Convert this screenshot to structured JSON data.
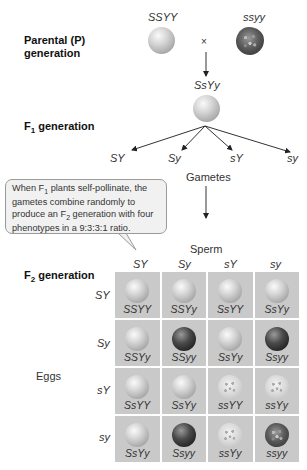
{
  "parental": {
    "label_line1": "Parental (P)",
    "label_line2": "generation",
    "parent1": {
      "genotype": "SSYY",
      "phenotype": "yellow-round"
    },
    "cross_symbol": "×",
    "parent2": {
      "genotype": "ssyy",
      "phenotype": "green-wrinkled"
    }
  },
  "f1": {
    "label_main": "F",
    "label_sub": "1",
    "label_rest": " generation",
    "genotype": "SsYy",
    "phenotype": "yellow-round"
  },
  "gametes": {
    "items": [
      "SY",
      "Sy",
      "sY",
      "sy"
    ],
    "label": "Gametes"
  },
  "callout": {
    "line1_a": "When F",
    "line1_sub": "1",
    "line1_b": " plants self-pollinate, the",
    "line2": "gametes combine randomly to",
    "line3_a": "produce an F",
    "line3_sub": "2",
    "line3_b": " generation with four",
    "line4": "phenotypes in a 9:3:3:1 ratio."
  },
  "f2": {
    "label_main": "F",
    "label_sub": "2",
    "label_rest": " generation",
    "sperm_label": "Sperm",
    "eggs_label": "Eggs",
    "sperm": [
      "SY",
      "Sy",
      "sY",
      "sy"
    ],
    "eggs": [
      "SY",
      "Sy",
      "sY",
      "sy"
    ],
    "rows": [
      [
        {
          "g": "SSYY",
          "p": "yr"
        },
        {
          "g": "SSYy",
          "p": "yr"
        },
        {
          "g": "SsYY",
          "p": "yr"
        },
        {
          "g": "SsYy",
          "p": "yr"
        }
      ],
      [
        {
          "g": "SSYy",
          "p": "yr"
        },
        {
          "g": "SSyy",
          "p": "gr"
        },
        {
          "g": "SsYy",
          "p": "yr"
        },
        {
          "g": "Ssyy",
          "p": "gr"
        }
      ],
      [
        {
          "g": "SsYY",
          "p": "yr"
        },
        {
          "g": "SsYy",
          "p": "yr"
        },
        {
          "g": "ssYY",
          "p": "yw"
        },
        {
          "g": "ssYy",
          "p": "yw"
        }
      ],
      [
        {
          "g": "SsYy",
          "p": "yr"
        },
        {
          "g": "Ssyy",
          "p": "gr"
        },
        {
          "g": "ssYy",
          "p": "yw"
        },
        {
          "g": "ssyy",
          "p": "gw"
        }
      ]
    ]
  },
  "colors": {
    "cell_bg": "#c9c9c9",
    "callout_bg": "#f1f1f1",
    "callout_border": "#9a9a9a"
  }
}
